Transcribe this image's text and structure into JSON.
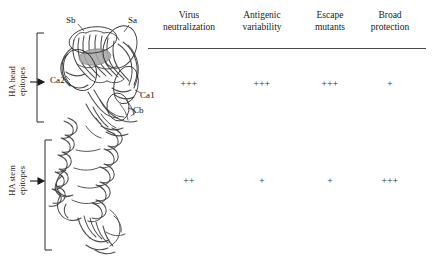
{
  "figure": {
    "structure_caption": "hemagglutinin-ribbon-structure",
    "regions": [
      {
        "id": "head",
        "label_line1": "HA head",
        "label_line2": "epitopes"
      },
      {
        "id": "stem",
        "label_line1": "HA stem",
        "label_line2": "epitopes"
      }
    ],
    "epitope_labels": [
      {
        "name": "Sb",
        "x": 66,
        "y": 20
      },
      {
        "name": "Sa",
        "x": 128,
        "y": 20
      },
      {
        "name": "Ca2",
        "x": 55,
        "y": 79
      },
      {
        "name": "Ca1",
        "x": 139,
        "y": 95
      },
      {
        "name": "Cb",
        "x": 131,
        "y": 110
      }
    ]
  },
  "table": {
    "columns": [
      {
        "line1": "Virus",
        "line2": "neutralization",
        "center": 189
      },
      {
        "line1": "Antigenic",
        "line2": "variability",
        "center": 262
      },
      {
        "line1": "Escape",
        "line2": "mutants",
        "center": 330
      },
      {
        "line1": "Broad",
        "line2": "protection",
        "center": 390
      }
    ],
    "rows": [
      {
        "region": "HA head epitopes",
        "y": 84,
        "values": [
          "+++",
          "+++",
          "+++",
          "+"
        ]
      },
      {
        "region": "HA stem epitopes",
        "y": 181,
        "values": [
          "++",
          "+",
          "+",
          "+++"
        ]
      }
    ]
  },
  "colors": {
    "ink": "#1a1a1a",
    "rule": "#4a4a4a",
    "ribbon": "#3a3a3a",
    "rbs_fill": "#a8a8a8",
    "background": "#ffffff"
  }
}
